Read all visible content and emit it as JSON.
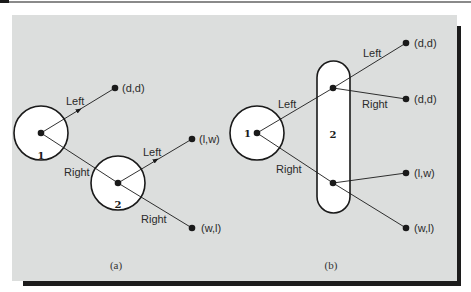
{
  "figure": {
    "colors": {
      "background": "#dcdedd",
      "node_fill": "#ffffff",
      "stroke": "#1a1a1a",
      "shadow": "#1c1c1c"
    },
    "panel_a": {
      "caption": "(a)",
      "player1_label": "1",
      "player2_label": "2",
      "edges": {
        "p1_left": "Left",
        "p1_right": "Right",
        "p2_left": "Left",
        "p2_right": "Right"
      },
      "payoffs": {
        "p1_left": "(d,d)",
        "p2_left": "(l,w)",
        "p2_right": "(w,l)"
      }
    },
    "panel_b": {
      "caption": "(b)",
      "player1_label": "1",
      "player2_label": "2",
      "edges": {
        "p1_left": "Left",
        "p1_right": "Right",
        "upper_left": "Left",
        "upper_right": "Right"
      },
      "payoffs": {
        "upper_left": "(d,d)",
        "upper_right": "(d,d)",
        "lower_left": "(l,w)",
        "lower_right": "(w,l)"
      }
    }
  }
}
